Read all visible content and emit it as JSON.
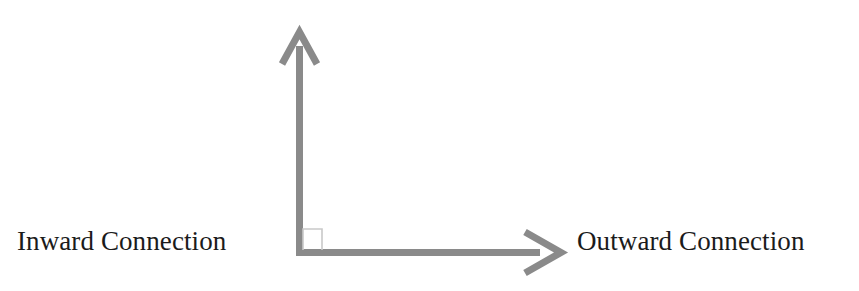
{
  "diagram": {
    "type": "two-axis quadrant diagram",
    "background_color": "#ffffff",
    "stroke_color": "#8a8a8a",
    "marker_color": "#c9c9c9",
    "text_color": "#1b1b1b",
    "axes": {
      "vertical": {
        "name": "vertical-axis",
        "arrowhead": "open-chevron-up"
      },
      "horizontal": {
        "name": "horizontal-axis",
        "arrowhead": "open-chevron-right"
      }
    },
    "right_angle_marker": {
      "name": "right-angle-marker",
      "style": "thin light gray square at origin"
    },
    "labels": {
      "left": "Inward Connection",
      "right": "Outward Connection"
    }
  }
}
